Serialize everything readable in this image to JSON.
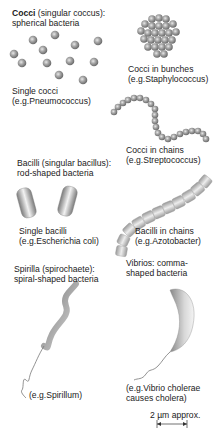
{
  "diagram": {
    "sections": {
      "cocci": {
        "heading_bold": "Cocci",
        "heading_rest": " (singular coccus):",
        "subheading": "spherical bacteria",
        "single_label": "Single cocci",
        "single_example": "(e.g.Pneumococcus)",
        "bunch_label": "Cocci in bunches",
        "bunch_example": "(e.g.Staphylococcus)",
        "chain_label": "Cocci in chains",
        "chain_example": "(e.g.Streptococcus)"
      },
      "bacilli": {
        "heading": "Bacilli  (singular bacillus):",
        "subheading": "rod-shaped bacteria",
        "single_label": "Single bacilli",
        "single_example": "(e.g.Escherichia coli)",
        "chain_label": "Bacilli in chains",
        "chain_example": "(e.g.Azotobacter)"
      },
      "spirilla": {
        "heading": "Spirilla  (spirochaete):",
        "subheading": "spiral-shaped bacteria",
        "example": "(e.g.Spirillum)"
      },
      "vibrios": {
        "heading": "Vibrios:  comma-",
        "subheading": "shaped bacteria",
        "example_line1": "(e.g.Vibrio cholerae",
        "example_line2": "causes cholera)"
      }
    },
    "scale_bar": {
      "label": "2 µm approx."
    }
  }
}
